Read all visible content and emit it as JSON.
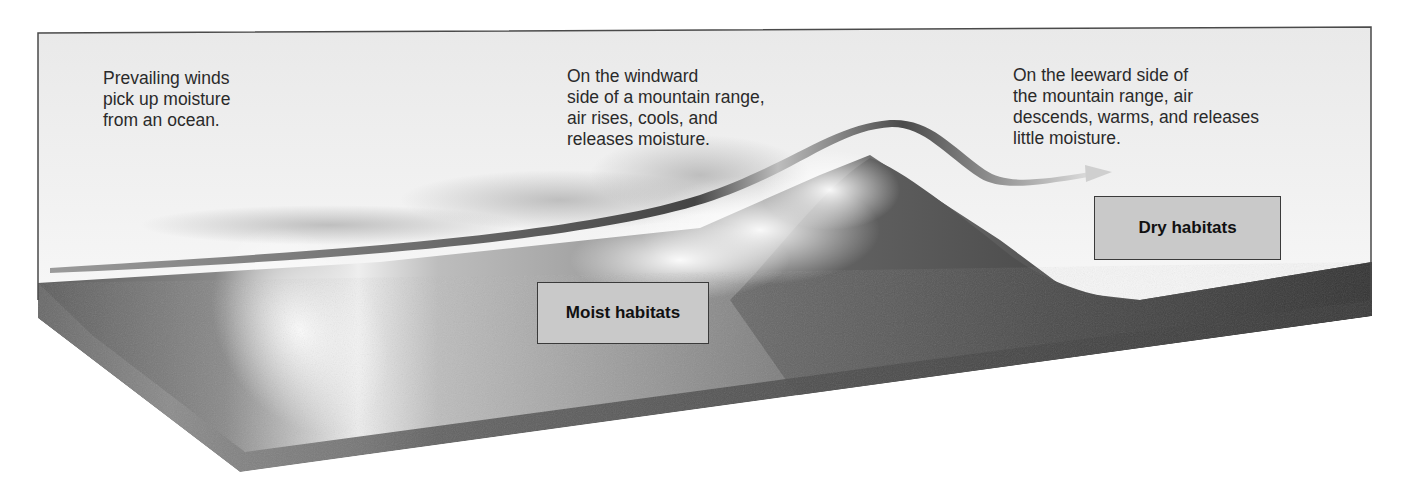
{
  "figure": {
    "colors": {
      "frame_border": "#4a4a4a",
      "sky": "#ececec",
      "ocean_surface": "#9a9a9a",
      "land_dark": "#3e3e3e",
      "label_fill": "#c9c9c9",
      "wind_ribbon": "#5a5a5a"
    }
  },
  "captions": {
    "ocean": "Prevailing winds\npick up moisture\nfrom an ocean.",
    "windward": "On the windward\nside of a mountain range,\nair rises, cools, and\nreleases moisture.",
    "leeward": "On the leeward side of\nthe mountain range, air\ndescends, warms, and releases\nlittle moisture."
  },
  "labels": {
    "moist": "Moist habitats",
    "dry": "Dry habitats"
  },
  "icons": {
    "wind_arrow": "wind-path-arrow-icon"
  }
}
